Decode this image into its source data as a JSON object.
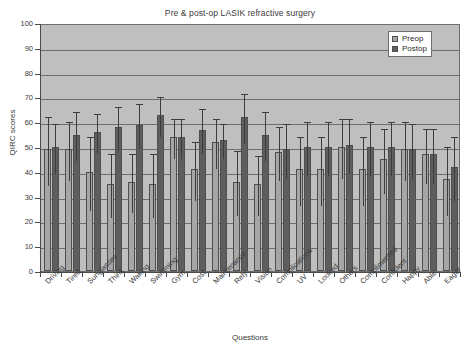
{
  "chart_data": {
    "type": "bar",
    "title": "Pre & post-op LASIK refractive surgery",
    "xlabel": "Questions",
    "ylabel": "QIRC scores",
    "ylim": [
      0,
      100
    ],
    "ytick_step": 10,
    "yticks": [
      0,
      10,
      20,
      30,
      40,
      50,
      60,
      70,
      80,
      90,
      100
    ],
    "grid": true,
    "legend_position": "top-right",
    "error_bars": "standard deviation",
    "categories": [
      "Driving",
      "Tired",
      "Sunglasses",
      "Think",
      "Waking",
      "Swimming",
      "Gym",
      "Cost",
      "Maintenance",
      "Rely",
      "Vision",
      "Complications",
      "UV",
      "Looked",
      "Others",
      "Complimented",
      "Confident",
      "Happy",
      "Able",
      "Eager"
    ],
    "series": [
      {
        "name": "Preop",
        "color": "#a6a6a6",
        "values": [
          49,
          49,
          40,
          35,
          36,
          35,
          54,
          41,
          52,
          36,
          35,
          48,
          41,
          41,
          50,
          41,
          45,
          49,
          47,
          37
        ],
        "errors": [
          14,
          12,
          15,
          13,
          12,
          13,
          8,
          12,
          10,
          13,
          12,
          11,
          14,
          14,
          12,
          14,
          13,
          12,
          11,
          14
        ]
      },
      {
        "name": "Postop",
        "color": "#5e5e5e",
        "values": [
          50,
          55,
          56,
          58,
          59,
          63,
          54,
          57,
          53,
          62,
          55,
          49,
          50,
          50,
          51,
          50,
          50,
          49,
          47,
          42
        ],
        "errors": [
          10,
          10,
          8,
          9,
          9,
          8,
          8,
          9,
          7,
          10,
          10,
          11,
          11,
          11,
          11,
          11,
          11,
          11,
          11,
          13
        ]
      }
    ]
  },
  "legend": {
    "items": [
      {
        "label": "Preop"
      },
      {
        "label": "Postop"
      }
    ]
  },
  "top_strip_text": ""
}
